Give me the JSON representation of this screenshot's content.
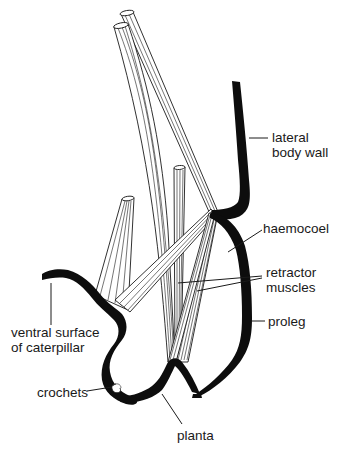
{
  "figure": {
    "colors": {
      "background": "#ffffff",
      "ink": "#0d0d0d",
      "label_text": "#1a1a1a"
    },
    "labels": {
      "lateral_body_wall_line1": "lateral",
      "lateral_body_wall_line2": "body wall",
      "haemocoel": "haemocoel",
      "retractor_muscles_line1": "retractor",
      "retractor_muscles_line2": "muscles",
      "proleg": "proleg",
      "ventral_surface_line1": "ventral surface",
      "ventral_surface_line2": "of caterpillar",
      "crochets": "crochets",
      "planta": "planta"
    }
  }
}
